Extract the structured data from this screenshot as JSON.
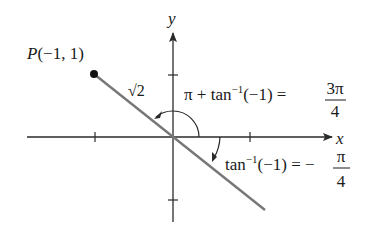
{
  "diagram": {
    "axes": {
      "x_label": "x",
      "y_label": "y"
    },
    "point": {
      "label": "P(−1, 1)",
      "name": "P",
      "coords": "(−1, 1)"
    },
    "segment_length_label": "√2",
    "angle_positive": {
      "lhs": "π + tan",
      "sup": "−1",
      "arg": "(−1) =",
      "num": "3π",
      "den": "4"
    },
    "angle_negative": {
      "lhs": "tan",
      "sup": "−1",
      "arg": "(−1) = −",
      "num": "π",
      "den": "4"
    },
    "colors": {
      "axis": "#2a2a2a",
      "line": "#777777",
      "point": "#111111",
      "text": "#1a1a1a"
    }
  }
}
